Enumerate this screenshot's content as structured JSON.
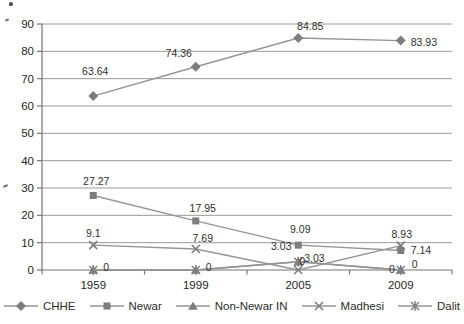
{
  "chart_data": {
    "type": "line",
    "title": "",
    "xlabel": "",
    "ylabel": "",
    "categories": [
      "1959",
      "1999",
      "2005",
      "2009"
    ],
    "ylim": [
      0,
      90
    ],
    "ytick_interval": 10,
    "yticks": [
      "0",
      "10",
      "20",
      "30",
      "40",
      "50",
      "60",
      "70",
      "80",
      "90"
    ],
    "grid": "horizontal-major",
    "legend_position": "bottom",
    "colors": {
      "series_line": "#959595",
      "series_marker": "#7d7d7d",
      "grid_line": "#9a9a9a",
      "axis_line": "#757575",
      "label_text": "#2f2f2f",
      "axis_text": "#1f1f1f"
    },
    "series": [
      {
        "name": "CHHE",
        "marker": "diamond",
        "values": [
          63.64,
          74.36,
          84.85,
          83.93
        ],
        "point_labels": [
          {
            "text": "63.64",
            "dx": 2,
            "dy": -21,
            "anchor": "middle"
          },
          {
            "text": "74.36",
            "dx": -17,
            "dy": -10,
            "anchor": "middle"
          },
          {
            "text": "84.85",
            "dx": 12,
            "dy": -8,
            "anchor": "middle"
          },
          {
            "text": "83.93",
            "dx": 10,
            "dy": 5,
            "anchor": "start"
          }
        ]
      },
      {
        "name": "Newar",
        "marker": "square",
        "values": [
          27.27,
          17.95,
          9.09,
          7.14
        ],
        "point_labels": [
          {
            "text": "27.27",
            "dx": 3,
            "dy": -10,
            "anchor": "middle"
          },
          {
            "text": "17.95",
            "dx": 7,
            "dy": -9,
            "anchor": "middle"
          },
          {
            "text": "9.09",
            "dx": 2,
            "dy": -12,
            "anchor": "middle"
          },
          {
            "text": "7.14",
            "dx": 10,
            "dy": 4,
            "anchor": "start"
          }
        ]
      },
      {
        "name": "Non-Newar IN",
        "marker": "triangle",
        "values": [
          0,
          0,
          3.03,
          0
        ],
        "point_labels": [
          {
            "text": "0",
            "dx": 10,
            "dy": 1,
            "anchor": "start"
          },
          {
            "text": "0",
            "dx": 10,
            "dy": 1,
            "anchor": "start"
          },
          {
            "text": "3.03",
            "dx": -17,
            "dy": -12,
            "anchor": "middle"
          },
          {
            "text": "0",
            "dx": 11,
            "dy": -2,
            "anchor": "start"
          }
        ]
      },
      {
        "name": "Madhesi",
        "marker": "x",
        "values": [
          9.1,
          7.69,
          0,
          8.93
        ],
        "point_labels": [
          {
            "text": "9.1",
            "dx": 0,
            "dy": -8,
            "anchor": "middle"
          },
          {
            "text": "7.69",
            "dx": 7,
            "dy": -7,
            "anchor": "middle"
          },
          {
            "text": "0",
            "dx": 4,
            "dy": -5,
            "anchor": "middle"
          },
          {
            "text": "8.93",
            "dx": 1,
            "dy": -8,
            "anchor": "middle"
          }
        ]
      },
      {
        "name": "Dalit",
        "marker": "asterisk",
        "values": [
          0,
          0,
          3.03,
          0
        ],
        "point_labels": [
          {
            "text": "",
            "dx": 0,
            "dy": 0,
            "anchor": "middle"
          },
          {
            "text": "",
            "dx": 0,
            "dy": 0,
            "anchor": "middle"
          },
          {
            "text": "3.03",
            "dx": 6,
            "dy": 0,
            "anchor": "start"
          },
          {
            "text": "0",
            "dx": -6,
            "dy": 3,
            "anchor": "end"
          }
        ]
      }
    ]
  }
}
